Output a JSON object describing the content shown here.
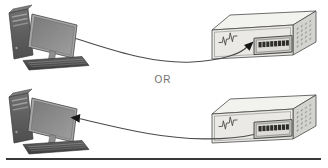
{
  "diagram": {
    "or_label": "OR",
    "connections": [
      {
        "from": "desktop-computer",
        "to": "ethernet-switch",
        "arrow_points_at": "switch-port"
      },
      {
        "from": "ethernet-switch",
        "to": "desktop-computer",
        "arrow_points_at": "computer-monitor"
      }
    ],
    "switch": {
      "visible_ports": 8
    },
    "icons": {
      "computer": "desktop-computer-icon",
      "switch": "ethernet-switch-icon",
      "cable": "curved-cable-line",
      "arrow": "solid-black-arrowhead"
    },
    "colors": {
      "background": "#ffffff",
      "cable": "#4a4a4a",
      "arrow": "#161616",
      "switch_top": "#f2f2ef",
      "switch_front": "#eae9e5",
      "switch_side": "#d3d3d0",
      "port": "#2d2d2b",
      "pc_dark": "#4e4e4e",
      "pc_light": "#a6a6a6",
      "divider": "#383838",
      "or_text": "#6f6f6f"
    }
  }
}
